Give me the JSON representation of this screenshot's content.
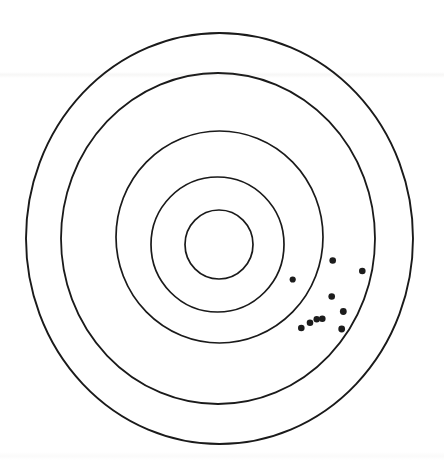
{
  "figure": {
    "kind": "concentric-ring-target",
    "title": "Shooting target with scored impact points",
    "width": 444,
    "height": 472,
    "background_color": "#ffffff",
    "ink_color": "#1a1a1a",
    "marker_color": "#1c1c1c"
  },
  "chart_data": {
    "type": "scatter",
    "title": "Shooting target with scored impact points",
    "subtitle": "",
    "xlabel": "",
    "ylabel": "",
    "coordinate_system": "pixel coordinates, origin at image top-left",
    "grid": false,
    "legend_position": "none",
    "xlim": [
      0,
      444
    ],
    "ylim": [
      0,
      472
    ],
    "target": {
      "center_x": 220,
      "center_y": 240,
      "ring_count": 5,
      "ring_stroke_width": 1.7,
      "ring_fill": "none",
      "rings": [
        {
          "index": 1,
          "name": "outer-ring",
          "score": 1,
          "rx": 193.5,
          "ry": 205.5,
          "cx": 219.5,
          "cy": 238.5
        },
        {
          "index": 2,
          "name": "ring-2",
          "score": 2,
          "rx": 157.0,
          "ry": 165.5,
          "cx": 218.0,
          "cy": 238.5
        },
        {
          "index": 3,
          "name": "ring-3",
          "score": 3,
          "rx": 103.5,
          "ry": 106.0,
          "cx": 219.5,
          "cy": 237.0
        },
        {
          "index": 4,
          "name": "ring-4",
          "score": 4,
          "rx": 66.5,
          "ry": 67.5,
          "cx": 217.5,
          "cy": 244.5
        },
        {
          "index": 5,
          "name": "bullseye",
          "score": 5,
          "rx": 34.0,
          "ry": 34.5,
          "cx": 219.0,
          "cy": 244.5
        }
      ]
    },
    "series": [
      {
        "name": "impact-points",
        "marker": "filled-circle",
        "marker_color": "#1c1c1c",
        "point_count": 10,
        "points": [
          {
            "id": 1,
            "x": 332.7,
            "y": 260.5,
            "r": 3.3,
            "ring": 2
          },
          {
            "id": 2,
            "x": 362.3,
            "y": 271.0,
            "r": 3.3,
            "ring": 1
          },
          {
            "id": 3,
            "x": 292.7,
            "y": 279.5,
            "r": 3.1,
            "ring": 3
          },
          {
            "id": 4,
            "x": 331.7,
            "y": 296.5,
            "r": 3.3,
            "ring": 2
          },
          {
            "id": 5,
            "x": 343.3,
            "y": 311.5,
            "r": 3.4,
            "ring": 2
          },
          {
            "id": 6,
            "x": 322.3,
            "y": 318.7,
            "r": 3.3,
            "ring": 2
          },
          {
            "id": 7,
            "x": 316.7,
            "y": 319.3,
            "r": 3.2,
            "ring": 2
          },
          {
            "id": 8,
            "x": 310.0,
            "y": 322.7,
            "r": 3.3,
            "ring": 2
          },
          {
            "id": 9,
            "x": 341.7,
            "y": 329.0,
            "r": 3.4,
            "ring": 2
          },
          {
            "id": 10,
            "x": 301.3,
            "y": 328.0,
            "r": 3.3,
            "ring": 2
          }
        ]
      }
    ],
    "annotations": []
  }
}
